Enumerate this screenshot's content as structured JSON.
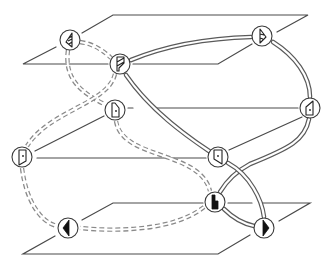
{
  "diagram": {
    "type": "three-plane connection diagram",
    "colors": {
      "background": "#ffffff",
      "line": "#4a4a4a",
      "solid_tube": "#5a5a5a",
      "dashed_tube": "#8a8a8a",
      "glyph_fill": "#111111"
    },
    "planes": [
      {
        "id": "top",
        "label": ""
      },
      {
        "id": "middle",
        "label": ""
      },
      {
        "id": "bottom",
        "label": ""
      }
    ],
    "nodes": [
      {
        "id": "A",
        "glyph": "half-triangle-left-hatched-icon",
        "plane": "top"
      },
      {
        "id": "B",
        "glyph": "flag-hatched-icon",
        "plane": "top"
      },
      {
        "id": "C",
        "glyph": "half-triangle-right-hatched-icon",
        "plane": "top"
      },
      {
        "id": "D",
        "glyph": "door-outline-icon",
        "plane": "middle"
      },
      {
        "id": "E",
        "glyph": "door-outline-slant-icon",
        "plane": "middle"
      },
      {
        "id": "F",
        "glyph": "door-outline-icon",
        "plane": "middle"
      },
      {
        "id": "G",
        "glyph": "door-outline-slant-icon",
        "plane": "middle"
      },
      {
        "id": "H",
        "glyph": "l-block-filled-icon",
        "plane": "bottom"
      },
      {
        "id": "I",
        "glyph": "half-disc-left-filled-icon",
        "plane": "bottom"
      },
      {
        "id": "J",
        "glyph": "half-disc-right-filled-icon",
        "plane": "bottom"
      }
    ],
    "solid_connections": [
      [
        "B",
        "C"
      ],
      [
        "C",
        "E"
      ],
      [
        "B",
        "G"
      ],
      [
        "E",
        "H"
      ],
      [
        "G",
        "J"
      ],
      [
        "G",
        "H"
      ],
      [
        "H",
        "J"
      ]
    ],
    "dashed_connections": [
      [
        "A",
        "B"
      ],
      [
        "A",
        "D"
      ],
      [
        "B",
        "F"
      ],
      [
        "D",
        "H"
      ],
      [
        "F",
        "I"
      ],
      [
        "H",
        "I"
      ]
    ]
  }
}
